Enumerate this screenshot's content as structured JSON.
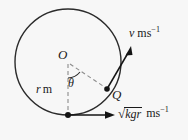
{
  "figure": {
    "type": "physics-circular-motion-diagram",
    "background_color": "#f7f7f7",
    "stroke_color": "#1a1a1a",
    "labels": {
      "centre": "O",
      "angle": "θ",
      "point": "Q",
      "radius": "r",
      "radius_unit": "m",
      "speed": "v",
      "speed_unit": "ms",
      "speed_unit_exponent": "−1",
      "bottom_speed_radical": "√",
      "bottom_speed_radicand": "kgr",
      "bottom_speed_unit": "ms",
      "bottom_speed_unit_exponent": "−1"
    },
    "geometry": {
      "circle_centre_x": 68,
      "circle_centre_y": 62,
      "circle_radius": 53,
      "point_Q_x": 107,
      "point_Q_y": 89,
      "bottom_point_x": 68,
      "bottom_point_y": 115,
      "velocity_arrow_tip_x": 131,
      "velocity_arrow_tip_y": 48,
      "bottom_arrow_tip_x": 114,
      "bottom_arrow_tip_y": 115
    }
  }
}
